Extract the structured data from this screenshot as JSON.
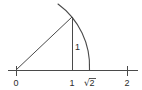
{
  "figure": {
    "background_color": "#ffffff",
    "stroke_color": "#4a4a4a",
    "text_color": "#2b2b2b",
    "width": 142,
    "height": 90
  },
  "axis": {
    "name": "number-line",
    "y_pixel": 70,
    "x_start_pixel": 8,
    "x_end_pixel": 138,
    "unit_pixels": 56,
    "origin_pixel": 16,
    "ticks": [
      {
        "label": "0",
        "value": 0,
        "x_pixel": 16,
        "is_radical": false
      },
      {
        "label": "1",
        "value": 1,
        "x_pixel": 72,
        "is_radical": false
      },
      {
        "label": "√2",
        "value": 1.4142,
        "x_pixel": 89,
        "is_radical": true,
        "radical_sign": "√",
        "radicand": "2"
      },
      {
        "label": "2",
        "value": 2,
        "x_pixel": 127,
        "is_radical": false
      }
    ]
  },
  "triangle": {
    "name": "unit-right-triangle",
    "origin": {
      "x": 16,
      "y": 70
    },
    "apex": {
      "x": 72,
      "y": 17
    },
    "foot": {
      "x": 72,
      "y": 70
    },
    "hypotenuse_length_value": "√2",
    "vertical_leg_label": "1",
    "vertical_leg_label_x": 75,
    "vertical_leg_label_y": 47,
    "horizontal_leg_label": "1"
  },
  "arc": {
    "name": "radius-sweep-arc",
    "center": {
      "x": 16,
      "y": 70
    },
    "radius_pixels": 77,
    "radius_value": "√2",
    "start": {
      "x": 58,
      "y": 5
    },
    "end": {
      "x": 89,
      "y": 70
    },
    "passes_through_apex": true
  },
  "labels": {
    "zero": "0",
    "one": "1",
    "sqrt_two": "√2",
    "two": "2",
    "leg": "1"
  }
}
